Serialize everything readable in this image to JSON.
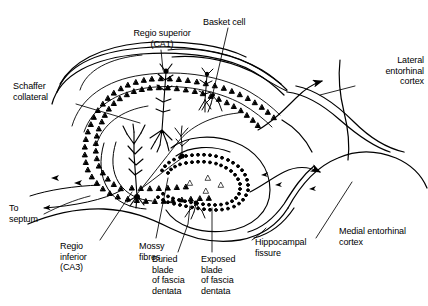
{
  "figure": {
    "background_color": "#ffffff",
    "ink_color": "#000000",
    "width": 428,
    "height": 306
  },
  "labels": {
    "regio_superior": "Regio superior\n(CA1)",
    "basket_cell": "Basket cell",
    "lateral_entorhinal": "Lateral\nentorhinal\ncortex",
    "schaffer_collateral": "Schaffer\ncollateral",
    "to_septum": "To\nseptum",
    "regio_inferior": "Regio\ninferior\n(CA3)",
    "mossy_fibres": "Mossy\nfibres",
    "buried_blade": "Buried\nblade\nof fascia\ndentata",
    "exposed_blade": "Exposed\nblade\nof fascia\ndentata",
    "hippocampal_fissure": "Hippocampal\nfissure",
    "medial_entorhinal": "Medial entorhinal\ncortex"
  },
  "structures": {
    "ca1_pyramidal_layer": "triangle-cell-band",
    "ca3_pyramidal_layer": "triangle-cell-band",
    "dentate_granule_layer": "dot-cell-band",
    "pyramidal_neuron": "apical-dendrite-neuron",
    "basket_interneuron": "basket-neuron",
    "perforant_path_arrow": "arrow-right"
  }
}
